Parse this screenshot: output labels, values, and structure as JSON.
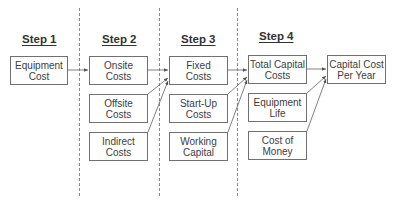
{
  "steps": [
    {
      "label": "Step 1"
    },
    {
      "label": "Step 2"
    },
    {
      "label": "Step 3"
    },
    {
      "label": "Step 4"
    }
  ],
  "boxes": {
    "equipment_cost": {
      "line1": "Equipment",
      "line2": "Cost"
    },
    "onsite_costs": {
      "line1": "Onsite",
      "line2": "Costs"
    },
    "offsite_costs": {
      "line1": "Offsite",
      "line2": "Costs"
    },
    "indirect_costs": {
      "line1": "Indirect",
      "line2": "Costs"
    },
    "fixed_costs": {
      "line1": "Fixed",
      "line2": "Costs"
    },
    "startup_costs": {
      "line1": "Start-Up",
      "line2": "Costs"
    },
    "working_capital": {
      "line1": "Working",
      "line2": "Capital"
    },
    "total_capital_costs": {
      "line1": "Total Capital",
      "line2": "Costs"
    },
    "equipment_life": {
      "line1": "Equipment",
      "line2": "Life"
    },
    "cost_of_money": {
      "line1": "Cost of",
      "line2": "Money"
    },
    "capital_cost_per_year": {
      "line1": "Capital Cost",
      "line2": "Per Year"
    }
  },
  "colors": {
    "line": "#707070",
    "text": "#3d3d3d"
  }
}
